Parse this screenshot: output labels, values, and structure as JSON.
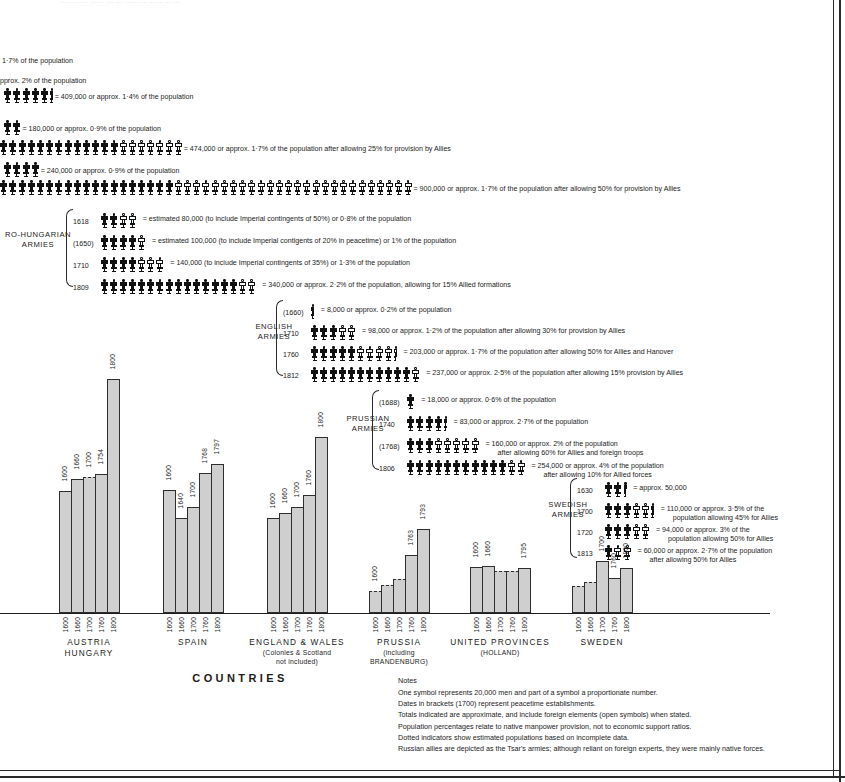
{
  "meta": {
    "cropped_top_line": "…………   ……  …  …   ………  ……   …  …"
  },
  "top_rows": [
    {
      "id": "row-crop-1",
      "caption": "1·7% of the population",
      "symbols": []
    },
    {
      "id": "row-crop-2",
      "caption": "approx. 2% of the population",
      "symbols": []
    },
    {
      "id": "row-french-409",
      "caption": "= 409,000 or approx. 1·4% of the population",
      "solid": 5,
      "open": 0,
      "partial": "solid"
    },
    {
      "id": "row-russian-180",
      "caption": "= 180,000 or approx. 0·9% of the population",
      "solid": 2,
      "open": 0,
      "partial": "none"
    },
    {
      "id": "row-474",
      "caption": "= 474,000 or approx. 1·7% of the population after allowing 25% for provision by Allies",
      "solid": 13,
      "open": 7,
      "partial": "none"
    },
    {
      "id": "row-240",
      "caption": "= 240,000 or approx. 0·9% of the population",
      "solid": 4,
      "open": 0,
      "partial": "none"
    },
    {
      "id": "row-900",
      "caption": "= 900,000 or approx. 1·7% of the population after allowing 50% for provision by Allies",
      "solid": 19,
      "open": 26,
      "partial": "none"
    }
  ],
  "army_groups": [
    {
      "id": "austro-hungarian",
      "title": "AUSTRO-HUNGARIAN\nARMIES",
      "title_lines": [
        "RO-HUNGARIAN",
        "ARMIES"
      ],
      "rows": [
        {
          "year": "1618",
          "solid": 2,
          "open": 2,
          "partial": "none",
          "caption": "=  estimated 80,000 (to include Imperial contingents of 50%) or 0·8% of the population"
        },
        {
          "year": "(1650)",
          "solid": 4,
          "open": 1,
          "partial": "none",
          "caption": "=  estimated 100,000 (to include Imperial contigents of 20% in peacetime) or 1% of the population"
        },
        {
          "year": "1710",
          "solid": 4,
          "open": 3,
          "partial": "none",
          "caption": "=  140,000 (to include Imperial contingents of 35%) or 1·3% of the population"
        },
        {
          "year": "1809",
          "solid": 15,
          "open": 2,
          "partial": "none",
          "caption": "=  340,000 or approx. 2·2% of the population, allowing for 15% Allied formations"
        }
      ]
    },
    {
      "id": "english",
      "title_lines": [
        "ENGLISH",
        "ARMIES"
      ],
      "rows": [
        {
          "year": "(1660)",
          "solid": 0,
          "open": 0,
          "partial": "solid",
          "caption": "=  8,000 or approx. 0·2% of the population"
        },
        {
          "year": "1710",
          "solid": 3,
          "open": 2,
          "partial": "none",
          "caption": "=  98,000 or approx. 1·2% of the population after allowing 30% for provision by Allies"
        },
        {
          "year": "1760",
          "solid": 5,
          "open": 4,
          "partial": "open",
          "caption": "=  203,000 or approx. 1·7% of the population after allowing 50% for Allies and Hanover"
        },
        {
          "year": "1812",
          "solid": 11,
          "open": 1,
          "partial": "none",
          "caption": "=  237,000 or approx. 2·5% of the population after allowing 15% provision by Allies"
        }
      ]
    },
    {
      "id": "prussian",
      "title_lines": [
        "PRUSSIAN",
        "ARMIES"
      ],
      "rows": [
        {
          "year": "(1688)",
          "solid": 1,
          "open": 0,
          "partial": "none",
          "caption": "=  18,000 or approx. 0·6% of the population"
        },
        {
          "year": "1740",
          "solid": 4,
          "open": 0,
          "partial": "solid",
          "caption": "=  83,000 or approx. 2·7% of the population"
        },
        {
          "year": "(1768)",
          "solid": 3,
          "open": 5,
          "partial": "none",
          "caption": "=  160,000 or approx. 2% of the population",
          "caption2": "after allowing 60% for Allies and foreign troops"
        },
        {
          "year": "1806",
          "solid": 11,
          "open": 2,
          "partial": "none",
          "caption": "=  254,000 or approx. 4% of the population",
          "caption2": "after allowing 10% for Allied forces"
        }
      ]
    },
    {
      "id": "swedish",
      "title_lines": [
        "SWEDISH",
        "ARMIES"
      ],
      "rows": [
        {
          "year": "1630",
          "solid": 2,
          "open": 0,
          "partial": "solid",
          "caption": "=  approx. 50,000"
        },
        {
          "year": "1700",
          "solid": 3,
          "open": 2,
          "partial": "solid",
          "caption": "=  110,000 or approx. 3·5% of the",
          "caption2": "population allowing 45% for Allies"
        },
        {
          "year": "1720",
          "solid": 3,
          "open": 2,
          "partial": "none",
          "caption": "=  94,000 or approx. 3% of the",
          "caption2": "population allowing 50% for Allies"
        },
        {
          "year": "1813",
          "solid": 1,
          "open": 2,
          "partial": "none",
          "caption": "=  60,000 or approx. 2·7% of the population",
          "caption2": "after allowing 50% for Allies"
        }
      ]
    }
  ],
  "chart_data": {
    "type": "bar",
    "title": "",
    "xlabel": "COUNTRIES",
    "ylabel": "",
    "grid": false,
    "legend": "none",
    "note": "Stepped bars: each country shows population at five dates; bar heights in chart units (px above baseline in the original plate).",
    "categories": [
      "RUSSIAN STATES",
      "AUSTRIA HUNGARY",
      "SPAIN",
      "ENGLAND & WALES",
      "PRUSSIA",
      "UNITED PROVINCES",
      "SWEDEN"
    ],
    "tick_labels": [
      "1600",
      "1660",
      "1700",
      "1760",
      "1800"
    ],
    "series": [
      {
        "name": "RUSSIAN STATES",
        "label_lines": [
          "RUSSIAN",
          "STATES"
        ],
        "sub": "",
        "cropped": true,
        "bars": [
          {
            "date": "1760",
            "height": 252,
            "dotted": false,
            "show_label": false
          },
          {
            "date": "1800",
            "height": 252,
            "dotted": false,
            "show_label": false
          }
        ]
      },
      {
        "name": "AUSTRIA HUNGARY",
        "label_lines": [
          "AUSTRIA",
          "HUNGARY"
        ],
        "sub": "",
        "bars": [
          {
            "date": "1600",
            "height": 122,
            "dotted": false,
            "show_label": true
          },
          {
            "date": "1660",
            "height": 134,
            "dotted": false,
            "show_label": true
          },
          {
            "date": "1700",
            "height": 136,
            "dotted": true,
            "show_label": true
          },
          {
            "date": "1754",
            "height": 139,
            "dotted": false,
            "show_label": true
          },
          {
            "date": "1800",
            "height": 234,
            "dotted": false,
            "show_label": true
          }
        ]
      },
      {
        "name": "SPAIN",
        "label_lines": [
          "SPAIN"
        ],
        "sub": "",
        "bars": [
          {
            "date": "1600",
            "height": 123,
            "dotted": false,
            "show_label": true
          },
          {
            "date": "1640",
            "height": 95,
            "dotted": false,
            "show_label": true
          },
          {
            "date": "1700",
            "height": 106,
            "dotted": false,
            "show_label": true
          },
          {
            "date": "1768",
            "height": 140,
            "dotted": false,
            "show_label": true
          },
          {
            "date": "1797",
            "height": 149,
            "dotted": false,
            "show_label": true
          }
        ]
      },
      {
        "name": "ENGLAND & WALES",
        "label_lines": [
          "ENGLAND  &  WALES"
        ],
        "sub": "(Colonies & Scotland\nnot included)",
        "sub_lines": [
          "(Colonies & Scotland",
          "not included)"
        ],
        "bars": [
          {
            "date": "1600",
            "height": 95,
            "dotted": false,
            "show_label": true
          },
          {
            "date": "1660",
            "height": 100,
            "dotted": false,
            "show_label": true
          },
          {
            "date": "1700",
            "height": 106,
            "dotted": false,
            "show_label": true
          },
          {
            "date": "1760",
            "height": 118,
            "dotted": false,
            "show_label": true
          },
          {
            "date": "1800",
            "height": 176,
            "dotted": false,
            "show_label": true
          }
        ]
      },
      {
        "name": "PRUSSIA",
        "label_lines": [
          "PRUSSIA"
        ],
        "sub": "(including BRANDENBURG)",
        "sub_lines": [
          "(including",
          "BRANDENBURG)"
        ],
        "bars": [
          {
            "date": "1600",
            "height": 22,
            "dotted": true,
            "show_label": true
          },
          {
            "date": "1660",
            "height": 28,
            "dotted": true,
            "show_label": false
          },
          {
            "date": "1700",
            "height": 34,
            "dotted": true,
            "show_label": false
          },
          {
            "date": "1763",
            "height": 58,
            "dotted": false,
            "show_label": true
          },
          {
            "date": "1793",
            "height": 84,
            "dotted": false,
            "show_label": true
          }
        ]
      },
      {
        "name": "UNITED PROVINCES",
        "label_lines": [
          "UNITED  PROVINCES"
        ],
        "sub": "(HOLLAND)",
        "sub_lines": [
          "(HOLLAND)"
        ],
        "bars": [
          {
            "date": "1600",
            "height": 46,
            "dotted": false,
            "show_label": true
          },
          {
            "date": "1660",
            "height": 47,
            "dotted": false,
            "show_label": true
          },
          {
            "date": "1700",
            "height": 42,
            "dotted": true,
            "show_label": false
          },
          {
            "date": "1760",
            "height": 42,
            "dotted": true,
            "show_label": false
          },
          {
            "date": "1795",
            "height": 45,
            "dotted": false,
            "show_label": true
          }
        ]
      },
      {
        "name": "SWEDEN",
        "label_lines": [
          "SWEDEN"
        ],
        "sub": "",
        "bars": [
          {
            "date": "1600",
            "height": 27,
            "dotted": true,
            "show_label": false
          },
          {
            "date": "1660",
            "height": 31,
            "dotted": true,
            "show_label": false
          },
          {
            "date": "1700",
            "height": 52,
            "dotted": false,
            "show_label": true
          },
          {
            "date": "1760",
            "height": 35,
            "dotted": false,
            "show_label": true
          },
          {
            "date": "1800",
            "height": 45,
            "dotted": false,
            "show_label": true
          }
        ]
      }
    ]
  },
  "notes": {
    "heading": "Notes",
    "lines": [
      "One symbol represents 20,000 men and part of a symbol a proportionate number.",
      "Dates in brackets (1700) represent peacetime establishments.",
      "Totals indicated are approximate, and include foreign elements (open symbols) when stated.",
      "Population percentages relate to native manpower provision, not to economic support ratios.",
      "Dotted indicators show estimated populations based on incomplete data.",
      "Russian allies are depicted as the Tsar's armies; although reliant on foreign experts, they were mainly native forces."
    ]
  },
  "colors": {
    "ink": "#1d1d1d",
    "bar_fill": "#cfcfcf",
    "bar_stroke": "#2e2e2e",
    "paper": "#ffffff"
  }
}
